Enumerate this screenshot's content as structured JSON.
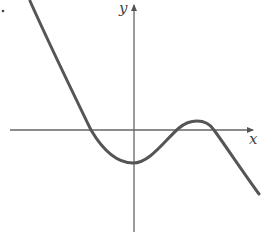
{
  "diagram": {
    "type": "function-graph",
    "axes": {
      "x_label": "x",
      "y_label": "y"
    },
    "curve": {
      "features": {
        "x_intercepts": 3,
        "local_min": "just right of y-axis, below x-axis",
        "local_max": "right of origin, slightly above x-axis",
        "end_behavior": "decreasing to the left (up), decreasing to the right (down)"
      }
    },
    "colors": {
      "curve": "#555555",
      "axes": "#555555",
      "background": "#ffffff"
    }
  }
}
